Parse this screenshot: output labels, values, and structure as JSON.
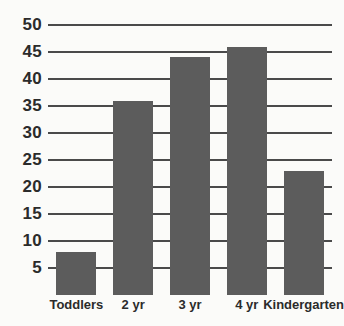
{
  "chart_data": {
    "type": "bar",
    "title": "",
    "subtitle": "",
    "xlabel": "",
    "ylabel": "",
    "categories": [
      "Toddlers",
      "2 yr",
      "3 yr",
      "4 yr",
      "Kindergarten"
    ],
    "values": [
      8,
      36,
      44,
      46,
      23
    ],
    "series": [
      {
        "name": "Enrollment",
        "values": [
          8,
          36,
          44,
          46,
          23
        ]
      }
    ],
    "ylim": [
      0,
      50
    ],
    "ytick_labels": [
      "50",
      "45",
      "40",
      "35",
      "30",
      "25",
      "20",
      "15",
      "10",
      "5"
    ],
    "ytick_values": [
      50,
      45,
      40,
      35,
      30,
      25,
      20,
      15,
      10,
      5
    ],
    "ytick_step": 5,
    "grid": true,
    "grid_orientation": "horizontal",
    "legend": false,
    "legend_position": "none",
    "annotations": [],
    "colors": {
      "bar": "#5c5c5c",
      "grid": "#4a4a4a",
      "text": "#2b2b2b",
      "background": "#fbfbf9"
    }
  }
}
